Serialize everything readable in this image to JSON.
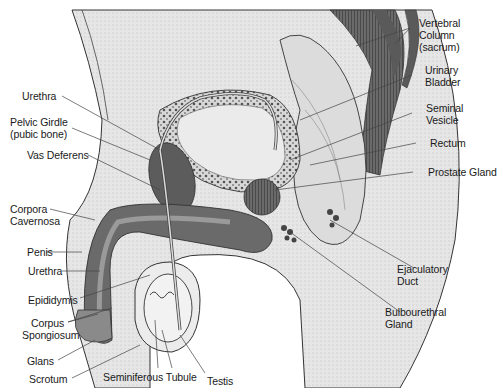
{
  "figure": {
    "colors": {
      "background": "#ffffff",
      "tissue_fill": "#e4e4e4",
      "dark_structure": "#5a5a5a",
      "outline": "#333333",
      "leader_line": "#444444",
      "label_text": "#1a1a1a"
    }
  },
  "labels": {
    "vertebral_column": [
      "Vertebral",
      "Column",
      "(sacrum)"
    ],
    "urinary_bladder": [
      "Urinary",
      "Bladder"
    ],
    "seminal_vesicle": [
      "Seminal",
      "Vesicle"
    ],
    "rectum": [
      "Rectum"
    ],
    "prostate_gland": [
      "Prostate Gland"
    ],
    "ejaculatory_duct": [
      "Ejaculatory",
      "Duct"
    ],
    "bulbourethral_gland": [
      "Bulbourethral",
      "Gland"
    ],
    "urethra_top": [
      "Urethra"
    ],
    "pelvic_girdle": [
      "Pelvic Girdle",
      "(pubic bone)"
    ],
    "vas_deferens": [
      "Vas Deferens"
    ],
    "corpora_cavernosa": [
      "Corpora",
      "Cavernosa"
    ],
    "penis": [
      "Penis"
    ],
    "urethra_bottom": [
      "Urethra"
    ],
    "epididymis": [
      "Epididymis"
    ],
    "corpus_spongiosum": [
      "Corpus",
      "Spongiosum"
    ],
    "glans": [
      "Glans"
    ],
    "scrotum": [
      "Scrotum"
    ],
    "seminiferous_tubule": [
      "Seminiferous Tubule"
    ],
    "testis": [
      "Testis"
    ]
  }
}
